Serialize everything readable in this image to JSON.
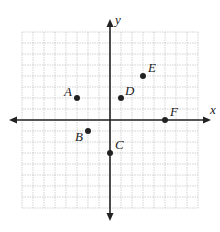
{
  "diagram": {
    "type": "coordinate-plane",
    "axes": {
      "x_label": "x",
      "y_label": "y"
    },
    "grid": {
      "x_min": -8,
      "x_max": 8,
      "y_min": -8,
      "y_max": 8,
      "cell_px": 11
    },
    "origin_px": {
      "x": 110,
      "y": 120
    },
    "colors": {
      "axis": "#222222",
      "grid": "#bfbfbf",
      "point": "#222222"
    },
    "points": [
      {
        "label": "A",
        "x": -3,
        "y": 2,
        "label_dx": -13,
        "label_dy": -2
      },
      {
        "label": "B",
        "x": -2,
        "y": -1,
        "label_dx": -13,
        "label_dy": 10
      },
      {
        "label": "C",
        "x": 0,
        "y": -3,
        "label_dx": 5,
        "label_dy": -4
      },
      {
        "label": "D",
        "x": 1,
        "y": 2,
        "label_dx": 4,
        "label_dy": -3
      },
      {
        "label": "E",
        "x": 3,
        "y": 4,
        "label_dx": 5,
        "label_dy": -4
      },
      {
        "label": "F",
        "x": 5,
        "y": 0,
        "label_dx": 5,
        "label_dy": -4
      }
    ]
  }
}
